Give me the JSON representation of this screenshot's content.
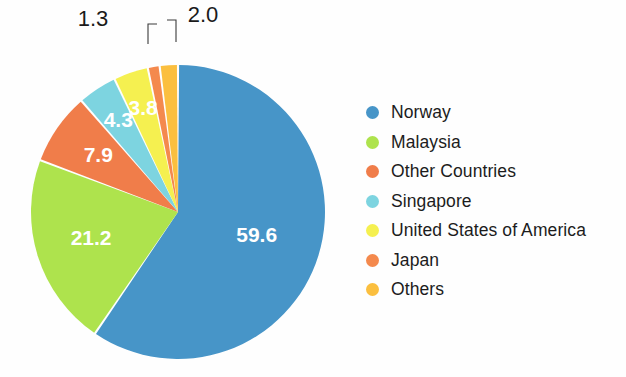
{
  "chart_data": {
    "type": "pie",
    "title": "",
    "subtitle": "",
    "xlabel": "",
    "ylabel": "",
    "legend_position": "right",
    "grid": false,
    "start_angle_deg": 0,
    "direction": "clockwise",
    "categories": [
      "Norway",
      "Malaysia",
      "Other Countries",
      "Singapore",
      "United States of America",
      "Japan",
      "Others"
    ],
    "values": [
      59.6,
      21.2,
      7.9,
      4.3,
      3.8,
      1.3,
      2.0
    ],
    "value_labels": [
      "59.6",
      "21.2",
      "7.9",
      "4.3",
      "3.8",
      "1.3",
      "2.0"
    ],
    "label_placement": [
      "inside",
      "inside",
      "inside",
      "inside",
      "inside",
      "outside",
      "outside"
    ],
    "colors": [
      "#4795C8",
      "#AEE34D",
      "#F07D4A",
      "#7DD4E0",
      "#F5F050",
      "#F4894D",
      "#FBBF3F"
    ],
    "slices": [
      {
        "name": "Norway",
        "value": 59.6,
        "label": "59.6",
        "color": "#4795C8",
        "placement": "inside"
      },
      {
        "name": "Malaysia",
        "value": 21.2,
        "label": "21.2",
        "color": "#AEE34D",
        "placement": "inside"
      },
      {
        "name": "Other Countries",
        "value": 7.9,
        "label": "7.9",
        "color": "#F07D4A",
        "placement": "inside"
      },
      {
        "name": "Singapore",
        "value": 4.3,
        "label": "4.3",
        "color": "#7DD4E0",
        "placement": "inside"
      },
      {
        "name": "United States of America",
        "value": 3.8,
        "label": "3.8",
        "color": "#F5F050",
        "placement": "inside"
      },
      {
        "name": "Japan",
        "value": 1.3,
        "label": "1.3",
        "color": "#F4894D",
        "placement": "outside"
      },
      {
        "name": "Others",
        "value": 2.0,
        "label": "2.0",
        "color": "#FBBF3F",
        "placement": "outside"
      }
    ]
  },
  "legend": {
    "items": [
      {
        "label": "Norway",
        "color": "#4795C8"
      },
      {
        "label": "Malaysia",
        "color": "#AEE34D"
      },
      {
        "label": "Other Countries",
        "color": "#F07D4A"
      },
      {
        "label": "Singapore",
        "color": "#7DD4E0"
      },
      {
        "label": "United States of America",
        "color": "#F5F050"
      },
      {
        "label": "Japan",
        "color": "#F4894D"
      },
      {
        "label": "Others",
        "color": "#FBBF3F"
      }
    ]
  }
}
